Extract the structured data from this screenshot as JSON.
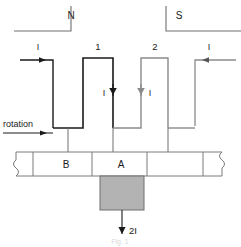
{
  "figure": {
    "caption": "Fig. 1",
    "poles": [
      {
        "name": "north-pole",
        "label": "N"
      },
      {
        "name": "south-pole",
        "label": "S"
      }
    ],
    "coils": [
      {
        "name": "coil-1",
        "label": "1"
      },
      {
        "name": "coil-2",
        "label": "2"
      }
    ],
    "currents": {
      "input_left": "I",
      "input_right": "I",
      "branch_left": "I",
      "branch_right": "I",
      "output": "2I"
    },
    "rotation_label": "rotation",
    "commutator_segments": [
      {
        "name": "segment-b",
        "label": "B"
      },
      {
        "name": "segment-a",
        "label": "A"
      }
    ],
    "colors": {
      "dark_wire": "#1a1a1a",
      "light_wire": "#8a8a8a",
      "brush_fill": "#b3b3b3",
      "brush_stroke": "#6e6e6e",
      "commutator_stroke": "#7a7a7a",
      "text": "#1a1a1a"
    }
  }
}
